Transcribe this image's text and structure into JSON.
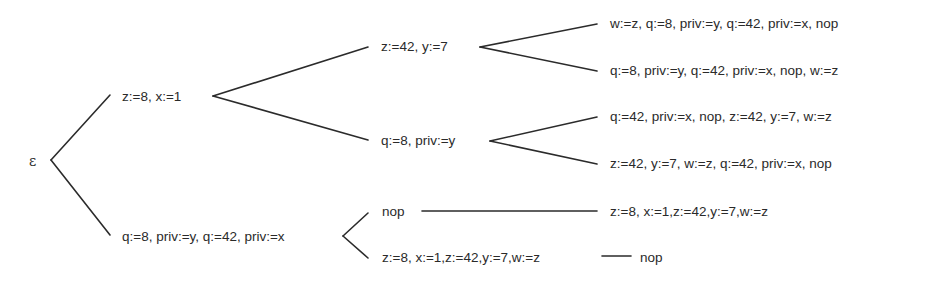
{
  "tree": {
    "root": {
      "label": "ε"
    },
    "level1": [
      {
        "label": "z:=8, x:=1"
      },
      {
        "label": "q:=8, priv:=y, q:=42, priv:=x"
      }
    ],
    "level2": [
      {
        "label": "z:=42, y:=7"
      },
      {
        "label": "q:=8, priv:=y"
      },
      {
        "label": "nop"
      },
      {
        "label": "z:=8, x:=1,z:=42,y:=7,w:=z"
      }
    ],
    "leaves": [
      {
        "label": "w:=z, q:=8, priv:=y, q:=42, priv:=x, nop"
      },
      {
        "label": "q:=8, priv:=y, q:=42, priv:=x, nop, w:=z"
      },
      {
        "label": "q:=42, priv:=x, nop, z:=42, y:=7, w:=z"
      },
      {
        "label": "z:=42, y:=7, w:=z, q:=42, priv:=x, nop"
      },
      {
        "label": "z:=8, x:=1,z:=42,y:=7,w:=z"
      },
      {
        "label": "nop"
      }
    ]
  }
}
